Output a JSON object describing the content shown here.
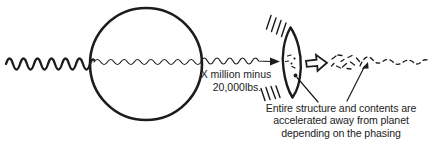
{
  "labels": {
    "mass": {
      "line1": "X million minus",
      "line2": "20,000lbs."
    },
    "caption": {
      "line1": "Entire structure and contents are",
      "line2": "accelerated away from planet",
      "line3": "depending on the phasing"
    }
  },
  "icons": {
    "block_arrow_icon": "⇨"
  },
  "colors": {
    "ink": "#1c1c1c",
    "background": "#ffffff"
  }
}
